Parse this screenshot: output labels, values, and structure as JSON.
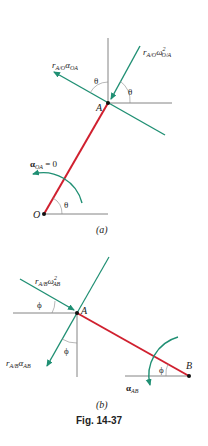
{
  "figure": {
    "caption": "Fig. 14-37",
    "colors": {
      "link": "#d0202f",
      "vector": "#1f8f73",
      "reference": "#555555",
      "text": "#222222"
    }
  },
  "panel_a": {
    "label": "(a)",
    "point_A": "A",
    "point_O": "O",
    "angle_theta": "θ",
    "alpha_label": {
      "main": "α",
      "sub": "OA",
      "suffix": " = 0"
    },
    "tangential_label": {
      "r": "r",
      "r_sub": "A/O",
      "main": "α",
      "sub": "OA"
    },
    "normal_label": {
      "r": "r",
      "r_sub": "A/O",
      "main": "ω",
      "sup": "2",
      "sub": "O/A"
    }
  },
  "panel_b": {
    "label": "(b)",
    "point_A": "A",
    "point_B": "B",
    "angle_phi": "ϕ",
    "alpha_label": {
      "main": "α",
      "sub": "AB"
    },
    "tangential_label": {
      "r": "r",
      "r_sub": "A/B",
      "main": "α",
      "sub": "AB"
    },
    "normal_label": {
      "r": "r",
      "r_sub": "A/B",
      "main": "ω",
      "sup": "2",
      "sub": "AB"
    }
  }
}
